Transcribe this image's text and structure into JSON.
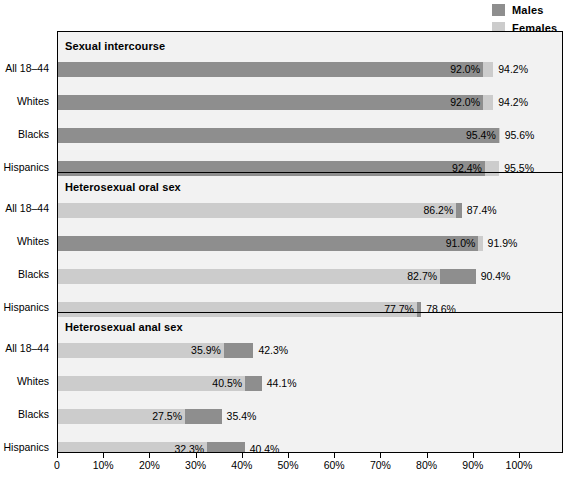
{
  "legend": {
    "position": "top-right",
    "items": [
      {
        "label": "Males",
        "color": "#8e8e8e",
        "key": "males"
      },
      {
        "label": "Females",
        "color": "#cccccc",
        "key": "females"
      }
    ]
  },
  "axis": {
    "min": 0,
    "max": 100,
    "step": 10,
    "ticks": [
      "0",
      "10%",
      "20%",
      "30%",
      "40%",
      "50%",
      "60%",
      "70%",
      "80%",
      "90%",
      "100%"
    ]
  },
  "colors": {
    "males": "#8e8e8e",
    "females": "#cccccc",
    "panel_background": "#f2f2f2",
    "frame": "#000000",
    "text": "#000000"
  },
  "chart_data": {
    "type": "bar",
    "orientation": "horizontal",
    "title": "",
    "xlabel": "",
    "ylabel": "",
    "xlim": [
      0,
      100
    ],
    "grid": false,
    "legend_position": "top-right",
    "categories": [
      "All 18–44",
      "Whites",
      "Blacks",
      "Hispanics"
    ],
    "series": [
      {
        "name": "Males",
        "color": "#8e8e8e"
      },
      {
        "name": "Females",
        "color": "#cccccc"
      }
    ],
    "panels": [
      {
        "title": "Sexual intercourse",
        "rows": [
          {
            "category": "All 18–44",
            "males": 92.0,
            "females": 94.2,
            "males_label": "92.0%",
            "females_label": "94.2%"
          },
          {
            "category": "Whites",
            "males": 92.0,
            "females": 94.2,
            "males_label": "92.0%",
            "females_label": "94.2%"
          },
          {
            "category": "Blacks",
            "males": 95.4,
            "females": 95.6,
            "males_label": "95.4%",
            "females_label": "95.6%"
          },
          {
            "category": "Hispanics",
            "males": 92.4,
            "females": 95.5,
            "males_label": "92.4%",
            "females_label": "95.5%"
          }
        ]
      },
      {
        "title": "Heterosexual oral sex",
        "rows": [
          {
            "category": "All 18–44",
            "males": 87.4,
            "females": 86.2,
            "males_label": "87.4%",
            "females_label": "86.2%"
          },
          {
            "category": "Whites",
            "males": 91.0,
            "females": 91.9,
            "males_label": "91.0%",
            "females_label": "91.9%"
          },
          {
            "category": "Blacks",
            "males": 90.4,
            "females": 82.7,
            "males_label": "90.4%",
            "females_label": "82.7%"
          },
          {
            "category": "Hispanics",
            "males": 78.6,
            "females": 77.7,
            "males_label": "78.6%",
            "females_label": "77.7%"
          }
        ]
      },
      {
        "title": "Heterosexual anal sex",
        "rows": [
          {
            "category": "All 18–44",
            "males": 42.3,
            "females": 35.9,
            "males_label": "42.3%",
            "females_label": "35.9%"
          },
          {
            "category": "Whites",
            "males": 44.1,
            "females": 40.5,
            "males_label": "44.1%",
            "females_label": "40.5%"
          },
          {
            "category": "Blacks",
            "males": 35.4,
            "females": 27.5,
            "males_label": "35.4%",
            "females_label": "27.5%"
          },
          {
            "category": "Hispanics",
            "males": 40.4,
            "females": 32.3,
            "males_label": "40.4%",
            "females_label": "32.3%"
          }
        ]
      }
    ]
  }
}
